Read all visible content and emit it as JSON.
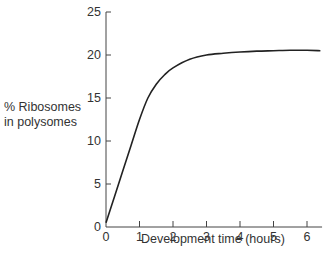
{
  "chart_data": {
    "type": "line",
    "title": "",
    "xlabel": "Development time (hours)",
    "ylabel": "% Ribosomes in polysomes",
    "ylabel_lines": [
      "% Ribosomes",
      "in polysomes"
    ],
    "xlim": [
      0,
      6.45
    ],
    "ylim": [
      0,
      25
    ],
    "xticks": [
      0,
      1,
      2,
      3,
      4,
      5,
      6
    ],
    "yticks": [
      0,
      5,
      10,
      15,
      20,
      25
    ],
    "grid": false,
    "legend": null,
    "series": [
      {
        "name": "% Ribosomes in polysomes",
        "x": [
          0,
          0.25,
          0.5,
          0.75,
          1.0,
          1.25,
          1.5,
          1.75,
          2.0,
          2.5,
          3.0,
          3.5,
          4.0,
          4.5,
          5.0,
          5.5,
          6.0,
          6.4
        ],
        "y": [
          0.5,
          3.5,
          6.5,
          9.5,
          12.5,
          15.0,
          16.6,
          17.7,
          18.5,
          19.5,
          20.0,
          20.2,
          20.35,
          20.45,
          20.5,
          20.55,
          20.55,
          20.5
        ]
      }
    ]
  }
}
